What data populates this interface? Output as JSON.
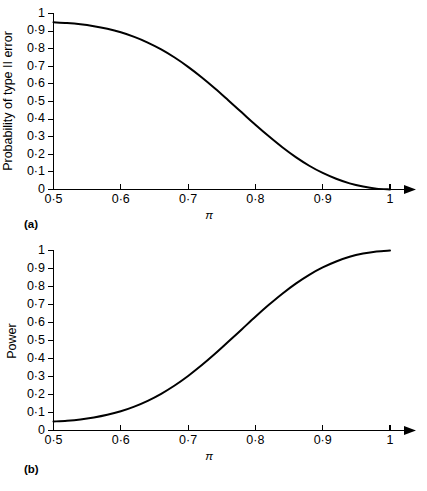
{
  "figure": {
    "background_color": "#ffffff",
    "ink_color": "#000000"
  },
  "chart_data": [
    {
      "type": "line",
      "panel_label": "(a)",
      "title": "",
      "xlabel": "π",
      "ylabel": "Probability of type II error",
      "xlim": [
        0.5,
        1.0
      ],
      "ylim": [
        0.0,
        1.0
      ],
      "grid": false,
      "legend": "none",
      "xticks": [
        0.5,
        0.6,
        0.7,
        0.8,
        0.9,
        1.0
      ],
      "xtick_labels": [
        "0·5",
        "0·6",
        "0·7",
        "0·8",
        "0·9",
        "1"
      ],
      "yticks": [
        0,
        0.1,
        0.2,
        0.3,
        0.4,
        0.5,
        0.6,
        0.7,
        0.8,
        0.9,
        1.0
      ],
      "ytick_labels": [
        "0",
        "0·1",
        "0·2",
        "0·3",
        "0·4",
        "0·5",
        "0·6",
        "0·7",
        "0·8",
        "0·9",
        "1"
      ],
      "series": [
        {
          "name": "Probability of type II error",
          "x": [
            0.5,
            0.52,
            0.54,
            0.56,
            0.58,
            0.6,
            0.62,
            0.64,
            0.66,
            0.68,
            0.7,
            0.72,
            0.74,
            0.76,
            0.78,
            0.8,
            0.82,
            0.84,
            0.86,
            0.88,
            0.9,
            0.92,
            0.94,
            0.96,
            0.98,
            1.0
          ],
          "values": [
            0.95,
            0.946,
            0.939,
            0.928,
            0.913,
            0.893,
            0.867,
            0.835,
            0.796,
            0.75,
            0.697,
            0.638,
            0.574,
            0.506,
            0.437,
            0.368,
            0.302,
            0.24,
            0.184,
            0.135,
            0.094,
            0.061,
            0.035,
            0.017,
            0.005,
            0.0
          ]
        }
      ]
    },
    {
      "type": "line",
      "panel_label": "(b)",
      "title": "",
      "xlabel": "π",
      "ylabel": "Power",
      "xlim": [
        0.5,
        1.0
      ],
      "ylim": [
        0.0,
        1.0
      ],
      "grid": false,
      "legend": "none",
      "xticks": [
        0.5,
        0.6,
        0.7,
        0.8,
        0.9,
        1.0
      ],
      "xtick_labels": [
        "0·5",
        "0·6",
        "0·7",
        "0·8",
        "0·9",
        "1"
      ],
      "yticks": [
        0,
        0.1,
        0.2,
        0.3,
        0.4,
        0.5,
        0.6,
        0.7,
        0.8,
        0.9,
        1.0
      ],
      "ytick_labels": [
        "0",
        "0·1",
        "0·2",
        "0·3",
        "0·4",
        "0·5",
        "0·6",
        "0·7",
        "0·8",
        "0·9",
        "1"
      ],
      "series": [
        {
          "name": "Power",
          "x": [
            0.5,
            0.52,
            0.54,
            0.56,
            0.58,
            0.6,
            0.62,
            0.64,
            0.66,
            0.68,
            0.7,
            0.72,
            0.74,
            0.76,
            0.78,
            0.8,
            0.82,
            0.84,
            0.86,
            0.88,
            0.9,
            0.92,
            0.94,
            0.96,
            0.98,
            1.0
          ],
          "values": [
            0.05,
            0.054,
            0.061,
            0.072,
            0.087,
            0.107,
            0.133,
            0.165,
            0.204,
            0.25,
            0.303,
            0.362,
            0.426,
            0.494,
            0.563,
            0.632,
            0.698,
            0.76,
            0.816,
            0.865,
            0.906,
            0.939,
            0.965,
            0.983,
            0.995,
            1.0
          ]
        }
      ]
    }
  ]
}
